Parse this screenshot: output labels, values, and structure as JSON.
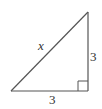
{
  "diagram": {
    "type": "right-triangle",
    "stroke_color": "#555555",
    "label_color": "#333333",
    "labels": {
      "hypotenuse": "x",
      "vertical_leg": "3",
      "horizontal_leg": "3"
    },
    "right_angle_marker": true
  }
}
